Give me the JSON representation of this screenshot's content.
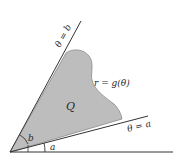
{
  "diagram": {
    "region_label": "Q",
    "curve_label": "r = g(θ)",
    "ray_upper_label": "θ = b",
    "ray_lower_label": "θ = a",
    "angle_b_label": "b",
    "angle_a_label": "a",
    "colors": {
      "region_fill": "#bdbdbd",
      "line": "#333333",
      "background": "#ffffff"
    }
  }
}
